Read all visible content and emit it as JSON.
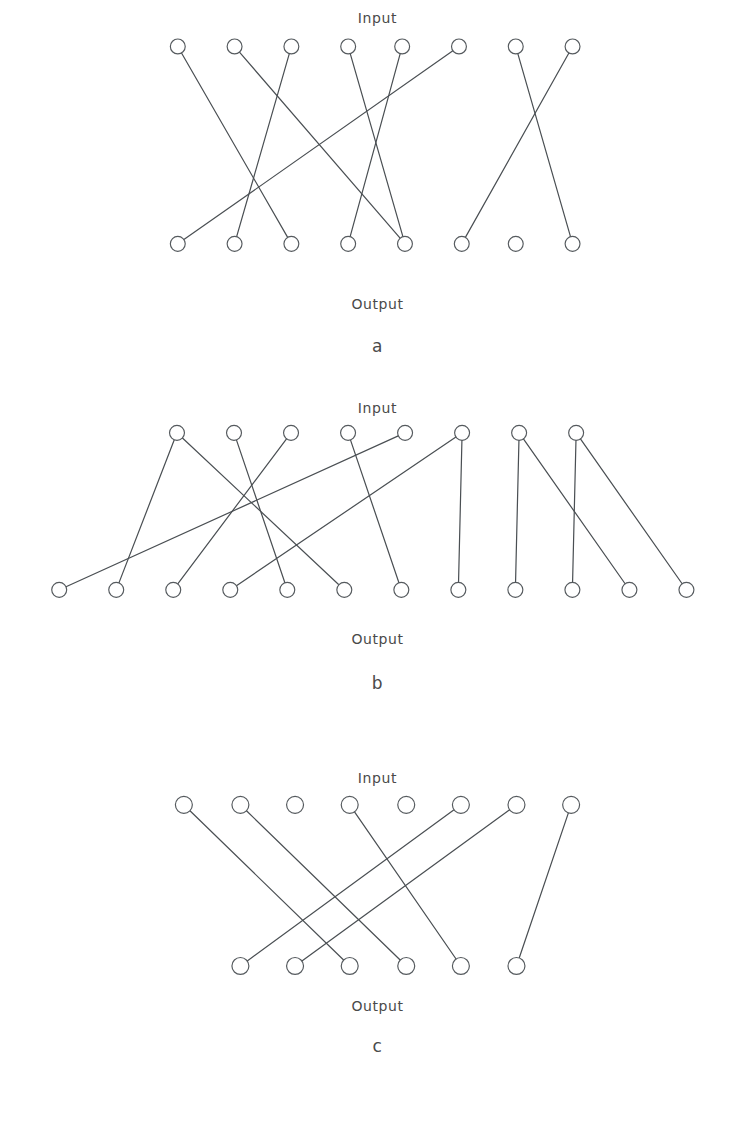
{
  "page": {
    "background": "#ffffff",
    "ink": "#4a4f53",
    "width": 755,
    "height": 1134
  },
  "labels": {
    "input": "Input",
    "output": "Output",
    "letter_a": "a",
    "letter_b": "b",
    "letter_c": "c"
  },
  "figures": [
    {
      "id": "a",
      "caption_top": "Input",
      "caption_bottom": "Output",
      "letter": "a",
      "top_count": 8,
      "bottom_count": 8,
      "top_x": [
        163,
        224,
        285,
        346,
        404,
        465,
        526,
        587
      ],
      "bottom_x": [
        163,
        224,
        285,
        346,
        407,
        468,
        526,
        587
      ],
      "top_y": 78,
      "bottom_y": 290,
      "radius": 8,
      "edges": [
        [
          0,
          2
        ],
        [
          1,
          4
        ],
        [
          2,
          1
        ],
        [
          3,
          4
        ],
        [
          4,
          3
        ],
        [
          5,
          0
        ],
        [
          6,
          7
        ],
        [
          7,
          5
        ]
      ]
    },
    {
      "id": "b",
      "caption_top": "Input",
      "caption_bottom": "Output",
      "letter": "b",
      "top_count": 8,
      "bottom_count": 12,
      "top_x": [
        163,
        224,
        285,
        346,
        407,
        468,
        529,
        590
      ],
      "bottom_x": [
        37,
        98,
        159,
        220,
        281,
        342,
        403,
        464,
        525,
        586,
        647,
        708
      ],
      "top_y": 477,
      "bottom_y": 645,
      "radius": 8,
      "edges": [
        [
          0,
          1
        ],
        [
          0,
          5
        ],
        [
          1,
          4
        ],
        [
          2,
          2
        ],
        [
          3,
          6
        ],
        [
          4,
          0
        ],
        [
          5,
          3
        ],
        [
          5,
          7
        ],
        [
          6,
          8
        ],
        [
          6,
          10
        ],
        [
          7,
          9
        ],
        [
          7,
          11
        ]
      ]
    },
    {
      "id": "c",
      "caption_top": "Input",
      "caption_bottom": "Output",
      "letter": "c",
      "top_count": 8,
      "bottom_count": 6,
      "top_x": [
        172,
        232,
        290,
        348,
        408,
        466,
        525,
        583
      ],
      "bottom_x": [
        232,
        290,
        348,
        408,
        466,
        525
      ],
      "top_y": 841,
      "bottom_y": 1012,
      "radius": 9,
      "edges": [
        [
          0,
          2
        ],
        [
          1,
          3
        ],
        [
          3,
          4
        ],
        [
          5,
          0
        ],
        [
          6,
          1
        ],
        [
          7,
          5
        ]
      ]
    }
  ]
}
